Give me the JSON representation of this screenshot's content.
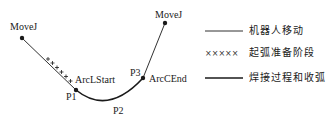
{
  "diagram": {
    "points": {
      "start": {
        "label": "MoveJ",
        "x": 22,
        "y": 38
      },
      "p1": {
        "label": "P1",
        "annotation": "ArcLStart",
        "x": 76,
        "y": 90
      },
      "p2": {
        "label": "P2",
        "x": 112,
        "y": 104
      },
      "p3": {
        "label": "P3",
        "annotation": "ArcCEnd",
        "x": 143,
        "y": 78
      },
      "end": {
        "label": "MoveJ",
        "x": 165,
        "y": 23
      }
    },
    "labels": {
      "movej_start": "MoveJ",
      "movej_end": "MoveJ",
      "arcl_start": "ArcLStart",
      "arcc_end": "ArcCEnd",
      "p1": "P1",
      "p2": "P2",
      "p3": "P3"
    },
    "legend": [
      {
        "style": "thin-line",
        "label": "机器人移动"
      },
      {
        "style": "crosses",
        "symbol": "×××××",
        "label": "起弧准备阶段"
      },
      {
        "style": "thick-line",
        "label": "焊接过程和收弧"
      }
    ],
    "colors": {
      "line": "#1a1a1a",
      "background": "#ffffff"
    }
  }
}
